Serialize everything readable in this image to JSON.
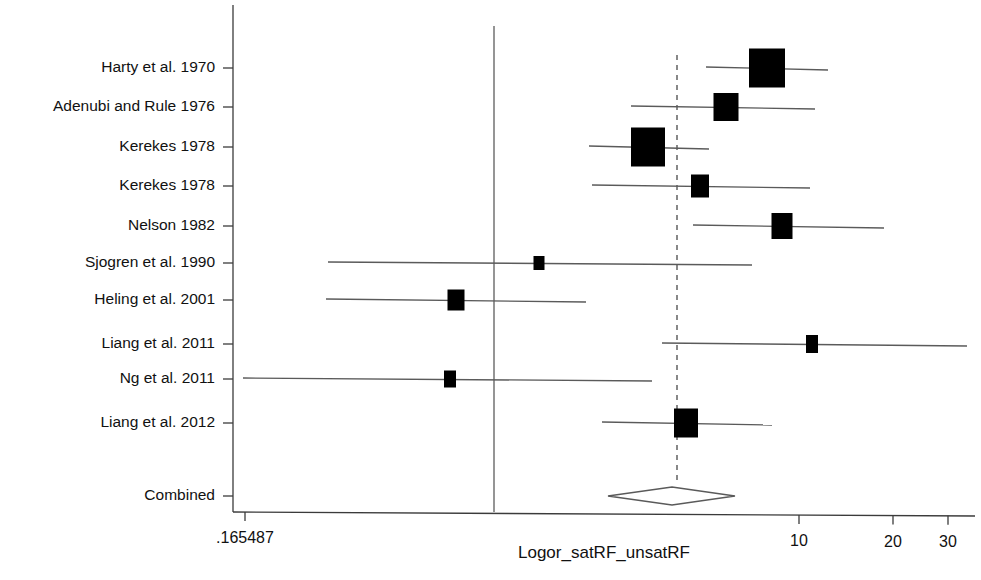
{
  "chart_data": {
    "type": "forest",
    "title": "",
    "xlabel": "Logor_satRF_unsatRF",
    "ylabel": "",
    "x_scale": "log",
    "grid": false,
    "legend": "none",
    "xlim": [
      0.165487,
      35
    ],
    "x_ticks": [
      {
        "label": ".165487",
        "value": 0.165487,
        "px": 245
      },
      {
        "label": "10",
        "value": 10,
        "px": 799
      },
      {
        "label": "20",
        "value": 20,
        "px": 893
      },
      {
        "label": "30",
        "value": 30,
        "px": 948
      }
    ],
    "reference_lines": [
      {
        "name": "null-effect-line",
        "style": "solid",
        "px": 494
      },
      {
        "name": "pooled-effect-line",
        "style": "dashed",
        "px": 677
      }
    ],
    "studies": [
      {
        "label": "Harty et al. 1970",
        "y_px": 68,
        "marker_px": 767,
        "marker_w": 36,
        "marker_h": 39,
        "ci_low_px": 706,
        "ci_high_px": 828
      },
      {
        "label": "Adenubi and Rule 1976",
        "y_px": 107,
        "marker_px": 726,
        "marker_w": 25,
        "marker_h": 28,
        "ci_low_px": 631,
        "ci_high_px": 815
      },
      {
        "label": "Kerekes 1978",
        "y_px": 147,
        "marker_px": 648,
        "marker_w": 34,
        "marker_h": 39,
        "ci_low_px": 589,
        "ci_high_px": 709
      },
      {
        "label": "Kerekes 1978",
        "y_px": 186,
        "marker_px": 700,
        "marker_w": 18,
        "marker_h": 23,
        "ci_low_px": 592,
        "ci_high_px": 810
      },
      {
        "label": "Nelson 1982",
        "y_px": 226,
        "marker_px": 782,
        "marker_w": 21,
        "marker_h": 26,
        "ci_low_px": 693,
        "ci_high_px": 884
      },
      {
        "label": "Sjogren et al. 1990",
        "y_px": 263,
        "marker_px": 539,
        "marker_w": 11,
        "marker_h": 14,
        "ci_low_px": 328,
        "ci_high_px": 752
      },
      {
        "label": "Heling et al. 2001",
        "y_px": 300,
        "marker_px": 456,
        "marker_w": 17,
        "marker_h": 21,
        "ci_low_px": 326,
        "ci_high_px": 586
      },
      {
        "label": "Liang et al. 2011",
        "y_px": 344,
        "marker_px": 812,
        "marker_w": 12,
        "marker_h": 18,
        "ci_low_px": 662,
        "ci_high_px": 967
      },
      {
        "label": "Ng et al. 2011",
        "y_px": 379,
        "marker_px": 450,
        "marker_w": 12,
        "marker_h": 17,
        "ci_low_px": 243,
        "ci_high_px": 652
      },
      {
        "label": "Liang et al. 2012",
        "y_px": 423,
        "marker_px": 686,
        "marker_w": 24,
        "marker_h": 29,
        "ci_low_px": 602,
        "ci_high_px": 772
      }
    ],
    "combined": {
      "label": "Combined",
      "y_px": 496,
      "center_px": 672,
      "low_px": 608,
      "high_px": 735,
      "half_height": 9
    },
    "axes_geometry": {
      "y_axis_x": 233,
      "y_axis_top": 5,
      "y_axis_bottom": 512,
      "x_axis_y": 512,
      "x_axis_left": 233,
      "x_axis_right": 975,
      "label_right_edge": 215,
      "tick_len": 10,
      "x_tick_len": 9,
      "null_line_top": 26,
      "ref_line_top": 55,
      "axis_title_x": 604,
      "axis_title_y": 558,
      "tick_label_y": 543
    }
  }
}
